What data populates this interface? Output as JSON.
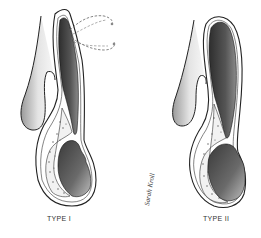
{
  "figure": {
    "panels": [
      {
        "id": "type-1",
        "label": "TYPE I",
        "has_dashed_outline": true
      },
      {
        "id": "type-2",
        "label": "TYPE II",
        "has_dashed_outline": false
      }
    ],
    "signature": "Sarah Kroll",
    "colors": {
      "dark_cavity": "#3a3a3a",
      "mid_shade": "#7a7a7a",
      "light_shade": "#d8d8d8",
      "outline": "#222222",
      "background": "#ffffff"
    }
  }
}
